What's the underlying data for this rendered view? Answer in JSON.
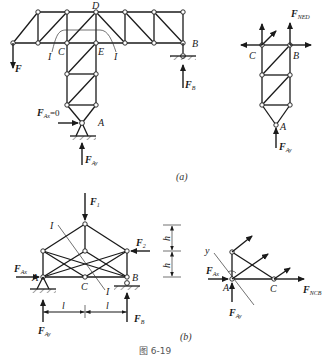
{
  "figure": {
    "caption": "图 6-19",
    "part_a_label": "(a)",
    "part_b_label": "(b)"
  },
  "part_a": {
    "node_labels": {
      "D": "D",
      "C": "C",
      "E": "E",
      "B": "B",
      "A": "A"
    },
    "section_label_left": "I",
    "section_label_right": "I",
    "forces": {
      "F": {
        "main": "F",
        "sub": ""
      },
      "FB": {
        "main": "F",
        "sub": "B"
      },
      "FAx": {
        "main": "F",
        "sub": "Ax",
        "suffix": "=0"
      },
      "FAy": {
        "main": "F",
        "sub": "Ay"
      }
    },
    "fbd": {
      "node_labels": {
        "C": "C",
        "B": "B",
        "A": "A"
      },
      "forces": {
        "FNED": {
          "main": "F",
          "sub": "NED"
        },
        "FAy": {
          "main": "F",
          "sub": "Ay"
        }
      }
    }
  },
  "part_b": {
    "node_labels": {
      "A": "A",
      "B": "B",
      "C": "C"
    },
    "section_label_top": "I",
    "section_label_bottom": "I",
    "dimensions": {
      "l_left": "l",
      "l_right": "l",
      "h_top": "h",
      "h_bottom": "h"
    },
    "forces": {
      "F1": {
        "main": "F",
        "sub": "1"
      },
      "F2": {
        "main": "F",
        "sub": "2"
      },
      "FAx": {
        "main": "F",
        "sub": "Ax"
      },
      "FAy": {
        "main": "F",
        "sub": "Ay"
      },
      "FB": {
        "main": "F",
        "sub": "B"
      }
    },
    "fbd": {
      "node_labels": {
        "A": "A",
        "C": "C"
      },
      "axis_label": "y",
      "forces": {
        "FAx": {
          "main": "F",
          "sub": "Ax"
        },
        "FAy": {
          "main": "F",
          "sub": "Ay"
        },
        "FNCB": {
          "main": "F",
          "sub": "NCB"
        }
      }
    }
  }
}
